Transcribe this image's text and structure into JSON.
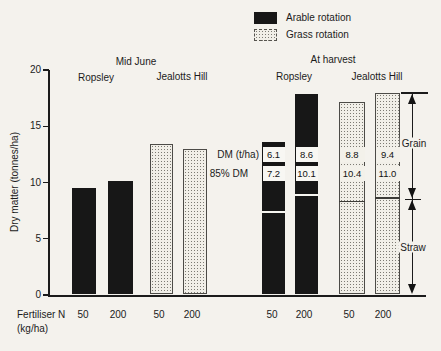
{
  "figure": {
    "background": "#f4f2ed",
    "ink": "#1b1b1b"
  },
  "legend": {
    "items": [
      {
        "label": "Arable rotation",
        "swatch": "black-solid"
      },
      {
        "label": "Grass rotation",
        "swatch": "dot-pattern"
      }
    ]
  },
  "headers": {
    "mid_june": "Mid June",
    "at_harvest": "At harvest",
    "mid_june_sites": [
      "Ropsley",
      "Jealotts Hill"
    ],
    "at_harvest_sites": [
      "Ropsley",
      "Jealotts Hill"
    ]
  },
  "row_labels": {
    "dm": "DM (t/ha)",
    "dm85": "85% DM"
  },
  "side_labels": {
    "grain": "Grain",
    "straw": "Straw"
  },
  "axes": {
    "y_label": "Dry matter (tonnes/ha)",
    "x_label_line1": "Fertiliser N",
    "x_label_line2": "(kg/ha)"
  },
  "chart_data": {
    "type": "bar",
    "title": "",
    "ylabel": "Dry matter (tonnes/ha)",
    "xlabel": "Fertiliser N (kg/ha)",
    "ylim": [
      0,
      20
    ],
    "y_ticks": [
      0,
      5,
      10,
      15,
      20
    ],
    "grid": false,
    "legend": [
      "Arable rotation",
      "Grass rotation"
    ],
    "x_tick_labels": [
      "50",
      "200",
      "50",
      "200",
      "50",
      "200",
      "50",
      "200"
    ],
    "bars": [
      {
        "stage": "Mid June",
        "site": "Ropsley",
        "fertiliser_n": "50",
        "rotation": "Arable rotation",
        "total_dm": 9.5
      },
      {
        "stage": "Mid June",
        "site": "Ropsley",
        "fertiliser_n": "200",
        "rotation": "Arable rotation",
        "total_dm": 10.1
      },
      {
        "stage": "Mid June",
        "site": "Jealotts Hill",
        "fertiliser_n": "50",
        "rotation": "Grass rotation",
        "total_dm": 13.4
      },
      {
        "stage": "Mid June",
        "site": "Jealotts Hill",
        "fertiliser_n": "200",
        "rotation": "Grass rotation",
        "total_dm": 13.0
      },
      {
        "stage": "At harvest",
        "site": "Ropsley",
        "fertiliser_n": "50",
        "rotation": "Arable rotation",
        "total_dm": 13.6,
        "grain_dm": "6.1",
        "grain_85pct": "7.2",
        "straw_boundary": 7.4
      },
      {
        "stage": "At harvest",
        "site": "Ropsley",
        "fertiliser_n": "200",
        "rotation": "Arable rotation",
        "total_dm": 17.9,
        "grain_dm": "8.6",
        "grain_85pct": "10.1",
        "straw_boundary": 8.9
      },
      {
        "stage": "At harvest",
        "site": "Jealotts Hill",
        "fertiliser_n": "50",
        "rotation": "Grass rotation",
        "total_dm": 17.2,
        "grain_dm": "8.8",
        "grain_85pct": "10.4",
        "straw_boundary": 8.4
      },
      {
        "stage": "At harvest",
        "site": "Jealotts Hill",
        "fertiliser_n": "200",
        "rotation": "Grass rotation",
        "total_dm": 18.0,
        "grain_dm": "9.4",
        "grain_85pct": "11.0",
        "straw_boundary": 8.7
      }
    ]
  }
}
